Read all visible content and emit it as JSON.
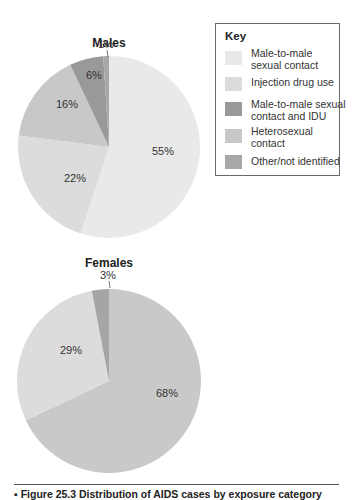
{
  "chart_data": [
    {
      "type": "pie",
      "title": "Males",
      "start_angle_deg": 0,
      "direction": "clockwise",
      "slices": [
        {
          "label": "Male-to-male sexual contact",
          "value": 55,
          "text": "55%",
          "color": "#e9e9e9"
        },
        {
          "label": "Injection drug use",
          "value": 22,
          "text": "22%",
          "color": "#dcdcdc"
        },
        {
          "label": "Heterosexual contact",
          "value": 16,
          "text": "16%",
          "color": "#c8c8c8"
        },
        {
          "label": "Male-to-male sexual contact and IDU",
          "value": 6,
          "text": "6%",
          "color": "#999999"
        },
        {
          "label": "Other/not identified",
          "value": 1,
          "text": "1%",
          "color": "#a8a8a8"
        }
      ]
    },
    {
      "type": "pie",
      "title": "Females",
      "start_angle_deg": 0,
      "direction": "clockwise",
      "slices": [
        {
          "label": "Heterosexual contact",
          "value": 68,
          "text": "68%",
          "color": "#c9c9c9"
        },
        {
          "label": "Injection drug use",
          "value": 29,
          "text": "29%",
          "color": "#dcdcdc"
        },
        {
          "label": "Other/not identified",
          "value": 3,
          "text": "3%",
          "color": "#a5a5a5"
        }
      ]
    }
  ],
  "legend": {
    "title": "Key",
    "position": "top-right",
    "items": [
      {
        "label": "Male-to-male sexual contact",
        "color": "#e9e9e9"
      },
      {
        "label": "Injection drug use",
        "color": "#dcdcdc"
      },
      {
        "label": "Male-to-male sexual contact and IDU",
        "color": "#999999"
      },
      {
        "label": "Heterosexual contact",
        "color": "#c8c8c8"
      },
      {
        "label": "Other/not identified",
        "color": "#a8a8a8"
      }
    ]
  },
  "caption": "▪ Figure 25.3  Distribution of AIDS cases by exposure category"
}
